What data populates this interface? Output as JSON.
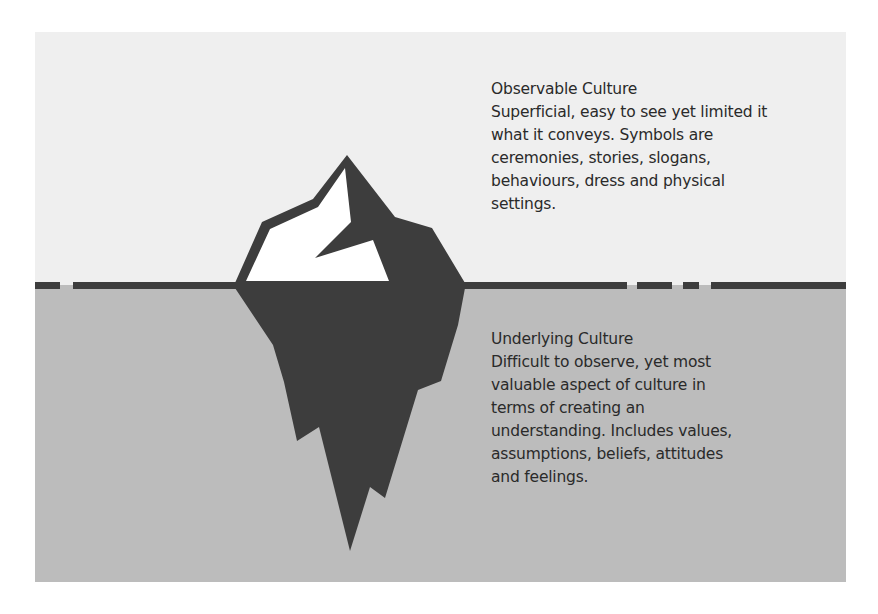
{
  "colors": {
    "sky": "#efefef",
    "water": "#bcbcbc",
    "iceberg_dark": "#3d3d3d",
    "iceberg_highlight": "#ffffff",
    "waterline": "#3d3d3d",
    "text": "#2a2a2a"
  },
  "diagram": {
    "type": "iceberg-model",
    "observable": {
      "title": "Observable Culture",
      "body_lines": [
        "Superficial, easy to see yet limited it",
        "what it conveys. Symbols are",
        "ceremonies, stories, slogans,",
        "behaviours, dress and physical",
        "settings."
      ]
    },
    "underlying": {
      "title": "Underlying Culture",
      "body_lines": [
        "Difficult to observe, yet most",
        "valuable aspect of culture in",
        "terms of creating an",
        "understanding. Includes values,",
        "assumptions, beliefs, attitudes",
        "and feelings."
      ]
    }
  }
}
